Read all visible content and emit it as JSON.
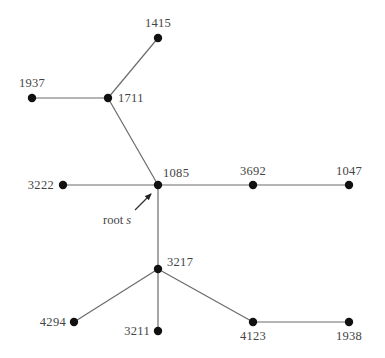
{
  "diagram": {
    "type": "tree",
    "root": "1085",
    "root_label": {
      "text": "root ",
      "var": "s"
    },
    "nodes": [
      {
        "id": "1415",
        "x": 158,
        "y": 38,
        "label": "1415",
        "lx": 158,
        "ly": 27,
        "anchor": "middle"
      },
      {
        "id": "1937",
        "x": 32,
        "y": 98,
        "label": "1937",
        "lx": 32,
        "ly": 87,
        "anchor": "middle"
      },
      {
        "id": "1711",
        "x": 108,
        "y": 98,
        "label": "1711",
        "lx": 118,
        "ly": 102,
        "anchor": "start"
      },
      {
        "id": "3222",
        "x": 63,
        "y": 185,
        "label": "3222",
        "lx": 54,
        "ly": 189,
        "anchor": "end"
      },
      {
        "id": "1085",
        "x": 158,
        "y": 185,
        "label": "1085",
        "lx": 163,
        "ly": 177,
        "anchor": "start"
      },
      {
        "id": "3692",
        "x": 253,
        "y": 185,
        "label": "3692",
        "lx": 253,
        "ly": 175,
        "anchor": "middle"
      },
      {
        "id": "1047",
        "x": 349,
        "y": 185,
        "label": "1047",
        "lx": 349,
        "ly": 175,
        "anchor": "middle"
      },
      {
        "id": "3217",
        "x": 158,
        "y": 269,
        "label": "3217",
        "lx": 167,
        "ly": 266,
        "anchor": "start"
      },
      {
        "id": "4294",
        "x": 74,
        "y": 322,
        "label": "4294",
        "lx": 66,
        "ly": 326,
        "anchor": "end"
      },
      {
        "id": "3211",
        "x": 158,
        "y": 331,
        "label": "3211",
        "lx": 150,
        "ly": 335,
        "anchor": "end"
      },
      {
        "id": "4123",
        "x": 253,
        "y": 322,
        "label": "4123",
        "lx": 253,
        "ly": 340,
        "anchor": "middle"
      },
      {
        "id": "1938",
        "x": 349,
        "y": 322,
        "label": "1938",
        "lx": 349,
        "ly": 340,
        "anchor": "middle"
      }
    ],
    "edges": [
      [
        "1415",
        "1711"
      ],
      [
        "1937",
        "1711"
      ],
      [
        "1711",
        "1085"
      ],
      [
        "3222",
        "1085"
      ],
      [
        "1085",
        "3692"
      ],
      [
        "3692",
        "1047"
      ],
      [
        "1085",
        "3217"
      ],
      [
        "3217",
        "4294"
      ],
      [
        "3217",
        "3211"
      ],
      [
        "3217",
        "4123"
      ],
      [
        "4123",
        "1938"
      ]
    ],
    "arrow": {
      "x1": 135,
      "y1": 210,
      "x2": 151,
      "y2": 194
    },
    "root_label_pos": {
      "x": 103,
      "y": 224
    },
    "colors": {
      "edge": "#6b6b6b",
      "node": "#111111",
      "text": "#444444"
    }
  }
}
